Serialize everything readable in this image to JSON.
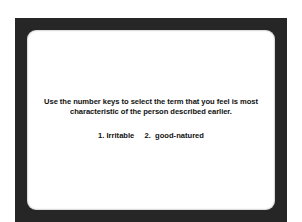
{
  "screen": {
    "prompt_line1": "Use the number keys to select the term that you feel is most",
    "prompt_line2": "characteristic of the person described earlier.",
    "options": [
      {
        "key": "1.",
        "label": "Irritable"
      },
      {
        "key": "2.",
        "label": "good-natured"
      }
    ]
  },
  "colors": {
    "frame": "#262626",
    "screen": "#ffffff",
    "text": "#111111"
  }
}
